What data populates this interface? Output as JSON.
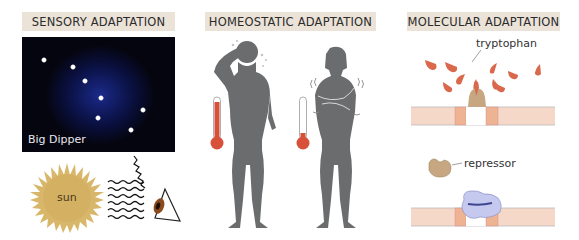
{
  "panels": [
    {
      "title": "SENSORY ADAPTATION",
      "night_sky_label": "Big Dipper",
      "stars": [
        [
          44,
          60
        ],
        [
          73,
          67
        ],
        [
          85,
          81
        ],
        [
          101,
          98
        ],
        [
          98,
          118
        ],
        [
          143,
          110
        ],
        [
          131,
          130
        ]
      ],
      "sun_label": "sun",
      "icons": [
        "night-sky",
        "star",
        "sun",
        "light-waves",
        "eye"
      ]
    },
    {
      "title": "HOMEOSTATIC ADAPTATION",
      "figures": [
        {
          "state": "hot",
          "description": "figure wiping brow, sweating",
          "thermometer_level": "high"
        },
        {
          "state": "cold",
          "description": "figure hugging self, shivering",
          "thermometer_level": "low"
        }
      ],
      "icons": [
        "woman-silhouette",
        "thermometer"
      ]
    },
    {
      "title": "MOLECULAR ADAPTATION",
      "tryptophan_label": "tryptophan",
      "repressor_label": "repressor",
      "icons": [
        "tryptophan-molecule",
        "repressor-protein",
        "dna-membrane"
      ]
    }
  ],
  "colors": {
    "header_bg": "#ece3d8",
    "night_sky": "#05050f",
    "sun": "#d9b76a",
    "silhouette": "#6a6c6d",
    "thermometer_red": "#d6503a",
    "tryptophan": "#d9684d",
    "repressor_tan": "#c6a782",
    "membrane": "#f6d8c8",
    "membrane_dark": "#eeb393",
    "complex_blue": "#c6c9ef"
  }
}
